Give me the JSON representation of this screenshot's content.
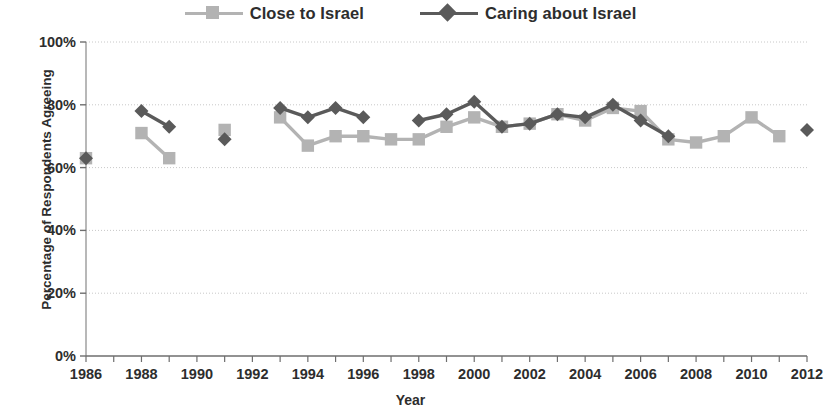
{
  "legend": {
    "position": "top-center",
    "entries": [
      {
        "label": "Close to Israel",
        "color": "#b3b3b3",
        "marker": "square"
      },
      {
        "label": "Caring about Israel",
        "color": "#5a5a5a",
        "marker": "diamond"
      }
    ]
  },
  "axes": {
    "x_title": "Year",
    "y_title": "Percentage of Respondents Agreeing",
    "y_ticks": [
      "0%",
      "20%",
      "40%",
      "60%",
      "80%",
      "100%"
    ],
    "x_ticks": [
      "1986",
      "1988",
      "1990",
      "1992",
      "1994",
      "1996",
      "1998",
      "2000",
      "2002",
      "2004",
      "2006",
      "2008",
      "2010",
      "2012"
    ]
  },
  "chart_data": {
    "type": "line",
    "title": "",
    "subtitle": "",
    "xlabel": "Year",
    "ylabel": "Percentage of Respondents Agreeing",
    "xlim": [
      1985.5,
      2012.5
    ],
    "ylim": [
      0,
      100
    ],
    "y_tick_values": [
      0,
      20,
      40,
      60,
      80,
      100
    ],
    "x_tick_values": [
      1986,
      1988,
      1990,
      1992,
      1994,
      1996,
      1998,
      2000,
      2002,
      2004,
      2006,
      2008,
      2010,
      2012
    ],
    "x_minor_tick_step": 1,
    "grid": "horizontal-dotted",
    "legend_position": "top-center",
    "units": "percent",
    "series": [
      {
        "name": "Close to Israel",
        "color": "#b3b3b3",
        "marker": "square",
        "points": [
          {
            "x": 1986,
            "y": 63
          },
          {
            "x": 1988,
            "y": 71
          },
          {
            "x": 1989,
            "y": 63
          },
          {
            "x": 1991,
            "y": 72
          },
          {
            "x": 1993,
            "y": 76
          },
          {
            "x": 1994,
            "y": 67
          },
          {
            "x": 1995,
            "y": 70
          },
          {
            "x": 1996,
            "y": 70
          },
          {
            "x": 1997,
            "y": 69
          },
          {
            "x": 1998,
            "y": 69
          },
          {
            "x": 1999,
            "y": 73
          },
          {
            "x": 2000,
            "y": 76
          },
          {
            "x": 2001,
            "y": 73
          },
          {
            "x": 2002,
            "y": 74
          },
          {
            "x": 2003,
            "y": 77
          },
          {
            "x": 2004,
            "y": 75
          },
          {
            "x": 2005,
            "y": 79
          },
          {
            "x": 2006,
            "y": 78
          },
          {
            "x": 2007,
            "y": 69
          },
          {
            "x": 2008,
            "y": 68
          },
          {
            "x": 2009,
            "y": 70
          },
          {
            "x": 2010,
            "y": 76
          },
          {
            "x": 2011,
            "y": 70
          }
        ]
      },
      {
        "name": "Caring about Israel",
        "color": "#5a5a5a",
        "marker": "diamond",
        "points": [
          {
            "x": 1986,
            "y": 63
          },
          {
            "x": 1988,
            "y": 78
          },
          {
            "x": 1989,
            "y": 73
          },
          {
            "x": 1991,
            "y": 69
          },
          {
            "x": 1993,
            "y": 79
          },
          {
            "x": 1994,
            "y": 76
          },
          {
            "x": 1995,
            "y": 79
          },
          {
            "x": 1996,
            "y": 76
          },
          {
            "x": 1998,
            "y": 75
          },
          {
            "x": 1999,
            "y": 77
          },
          {
            "x": 2000,
            "y": 81
          },
          {
            "x": 2001,
            "y": 73
          },
          {
            "x": 2002,
            "y": 74
          },
          {
            "x": 2003,
            "y": 77
          },
          {
            "x": 2004,
            "y": 76
          },
          {
            "x": 2005,
            "y": 80
          },
          {
            "x": 2006,
            "y": 75
          },
          {
            "x": 2007,
            "y": 70
          },
          {
            "x": 2012,
            "y": 72
          }
        ]
      }
    ]
  }
}
